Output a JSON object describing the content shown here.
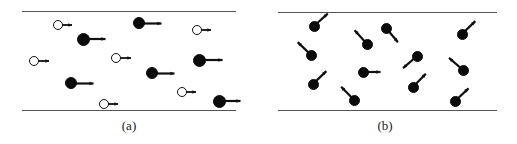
{
  "figure": {
    "width": 517,
    "height": 144,
    "background": "#ffffff",
    "line_color": "#555555",
    "particle_fill_color": "#0b0b0b",
    "particle_open_color": "#ffffff",
    "arrow_color": "#101010"
  },
  "panels": [
    {
      "id": "a",
      "label": "(a)",
      "label_x": 129,
      "label_y": 118,
      "wall_left": 22,
      "wall_right": 236,
      "wall_top_y": 11,
      "wall_bottom_y": 110,
      "particles": [
        {
          "cx": 58,
          "cy": 25,
          "r": 5.0,
          "type": "open",
          "angle": 0,
          "len": 9,
          "head": 4.0
        },
        {
          "cx": 139,
          "cy": 23,
          "r": 6.0,
          "type": "filled",
          "angle": 0,
          "len": 16,
          "head": 4.5
        },
        {
          "cx": 197,
          "cy": 30,
          "r": 5.0,
          "type": "open",
          "angle": 0,
          "len": 9,
          "head": 4.0
        },
        {
          "cx": 83,
          "cy": 39,
          "r": 6.5,
          "type": "filled",
          "angle": 0,
          "len": 16,
          "head": 4.5
        },
        {
          "cx": 34,
          "cy": 61,
          "r": 5.0,
          "type": "open",
          "angle": 0,
          "len": 10,
          "head": 4.0
        },
        {
          "cx": 116,
          "cy": 58,
          "r": 5.0,
          "type": "open",
          "angle": 0,
          "len": 10,
          "head": 4.0
        },
        {
          "cx": 199,
          "cy": 60,
          "r": 6.5,
          "type": "filled",
          "angle": 0,
          "len": 17,
          "head": 4.5
        },
        {
          "cx": 152,
          "cy": 73,
          "r": 6.0,
          "type": "filled",
          "angle": 0,
          "len": 16,
          "head": 4.5
        },
        {
          "cx": 71,
          "cy": 83,
          "r": 6.0,
          "type": "filled",
          "angle": 0,
          "len": 16,
          "head": 4.5
        },
        {
          "cx": 182,
          "cy": 92,
          "r": 5.0,
          "type": "open",
          "angle": 0,
          "len": 9,
          "head": 4.0
        },
        {
          "cx": 219,
          "cy": 101,
          "r": 6.5,
          "type": "filled",
          "angle": 0,
          "len": 15,
          "head": 4.5
        },
        {
          "cx": 104,
          "cy": 104,
          "r": 5.0,
          "type": "open",
          "angle": 0,
          "len": 9,
          "head": 4.0
        }
      ]
    },
    {
      "id": "b",
      "label": "(b)",
      "label_x": 385,
      "label_y": 118,
      "wall_left": 278,
      "wall_right": 497,
      "wall_top_y": 12,
      "wall_bottom_y": 110,
      "particles": [
        {
          "cx": 314,
          "cy": 26,
          "r": 5.5,
          "type": "filled",
          "angle": -42,
          "len": 13,
          "head": 4.5
        },
        {
          "cx": 386,
          "cy": 28,
          "r": 5.5,
          "type": "filled",
          "angle": 50,
          "len": 13,
          "head": 4.5
        },
        {
          "cx": 462,
          "cy": 34,
          "r": 5.5,
          "type": "filled",
          "angle": -44,
          "len": 13,
          "head": 4.5
        },
        {
          "cx": 367,
          "cy": 44,
          "r": 5.5,
          "type": "filled",
          "angle": -132,
          "len": 13,
          "head": 4.5
        },
        {
          "cx": 311,
          "cy": 55,
          "r": 5.5,
          "type": "filled",
          "angle": -136,
          "len": 13,
          "head": 4.5
        },
        {
          "cx": 417,
          "cy": 56,
          "r": 5.5,
          "type": "filled",
          "angle": 139,
          "len": 13,
          "head": 4.5
        },
        {
          "cx": 463,
          "cy": 70,
          "r": 5.5,
          "type": "filled",
          "angle": -139,
          "len": 13,
          "head": 4.5
        },
        {
          "cx": 363,
          "cy": 72,
          "r": 5.5,
          "type": "filled",
          "angle": 0,
          "len": 12,
          "head": 4.5
        },
        {
          "cx": 313,
          "cy": 84,
          "r": 5.5,
          "type": "filled",
          "angle": -44,
          "len": 13,
          "head": 4.5
        },
        {
          "cx": 413,
          "cy": 87,
          "r": 5.5,
          "type": "filled",
          "angle": -46,
          "len": 13,
          "head": 4.5
        },
        {
          "cx": 354,
          "cy": 100,
          "r": 5.5,
          "type": "filled",
          "angle": -134,
          "len": 13,
          "head": 4.5
        },
        {
          "cx": 455,
          "cy": 101,
          "r": 5.5,
          "type": "filled",
          "angle": -43,
          "len": 13,
          "head": 4.5
        }
      ]
    }
  ]
}
